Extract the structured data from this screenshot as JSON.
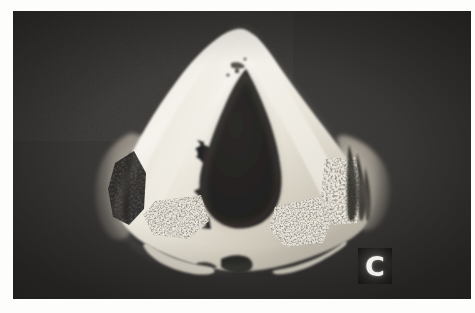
{
  "figure": {
    "kind": "grayscale-specimen-photograph",
    "panel_label": "C",
    "border": {
      "page_background": "#fdfdfc",
      "plate_background": "#3a3836"
    },
    "palette": {
      "background_dark": "#3a3836",
      "background_dark_deep": "#2e2c2b",
      "specimen_bright": "#f4f1ea",
      "specimen_mid": "#d8d3c7",
      "specimen_shadow": "#a39d91",
      "cavity_dark": "#272524",
      "marrow_dark": "#1e1d1c",
      "label_text": "#f2f0ec"
    },
    "regions": [
      {
        "name": "outer-cartilage-wall",
        "tone": "bright"
      },
      {
        "name": "central-lumen-cavity",
        "tone": "dark"
      },
      {
        "name": "left-marrow-space",
        "tone": "porous-dark"
      },
      {
        "name": "right-marrow-space",
        "tone": "porous-dark"
      },
      {
        "name": "inferior-marrow-space",
        "tone": "porous-dark"
      },
      {
        "name": "left-lateral-flange",
        "tone": "translucent-gray"
      },
      {
        "name": "right-lateral-flange",
        "tone": "translucent-gray"
      }
    ]
  }
}
